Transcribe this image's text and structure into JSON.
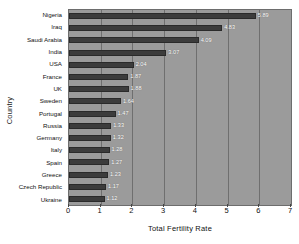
{
  "chart_data": {
    "type": "bar",
    "orientation": "horizontal",
    "title": "",
    "xlabel": "Total Fertility Rate",
    "ylabel": "Country",
    "xlim": [
      0,
      7
    ],
    "xticks": [
      0,
      1,
      2,
      3,
      4,
      5,
      6,
      7
    ],
    "grid": true,
    "legend": null,
    "categories": [
      "Nigeria",
      "Iraq",
      "Saudi Arabia",
      "India",
      "USA",
      "France",
      "UK",
      "Sweden",
      "Portugal",
      "Russia",
      "Germany",
      "Italy",
      "Spain",
      "Greece",
      "Czech Republic",
      "Ukraine"
    ],
    "values": [
      5.89,
      4.83,
      4.09,
      3.07,
      2.04,
      1.87,
      1.88,
      1.64,
      1.47,
      1.33,
      1.32,
      1.28,
      1.27,
      1.23,
      1.17,
      1.12
    ],
    "value_labels": [
      "5.89",
      "4.83",
      "4.09",
      "3.07",
      "2.04",
      "1.87",
      "1.88",
      "1.64",
      "1.47",
      "1.33",
      "1.32",
      "1.28",
      "1.27",
      "1.23",
      "1.17",
      "1.12"
    ],
    "colors": {
      "bar": "#3c3c3c",
      "plot_background": "#9b9b9b",
      "gridline": "#6f6f6f",
      "value_label": "#ffffff",
      "axis_text": "#111111",
      "figure_background": "#ffffff"
    }
  }
}
